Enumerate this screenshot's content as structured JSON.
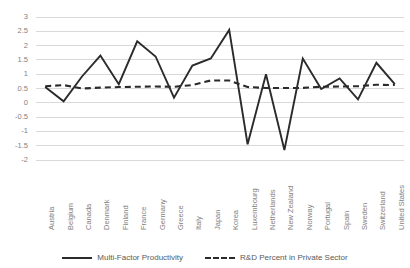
{
  "chart_data": {
    "type": "line",
    "title": "",
    "xlabel": "",
    "ylabel": "",
    "ylim": [
      -2,
      3
    ],
    "ytick_values": [
      3,
      2.5,
      2,
      1.5,
      1,
      0.5,
      0,
      -0.5,
      -1,
      -1.5,
      -2
    ],
    "ytick_labels": [
      "3",
      "2.5",
      "2",
      "1.5",
      "1",
      "0.5",
      "0",
      "-0.5",
      "-1",
      "-1.5",
      "-2"
    ],
    "grid": true,
    "legend_position": "bottom-center",
    "categories": [
      "Austria",
      "Belgium",
      "Canada",
      "Denmark",
      "Finland",
      "France",
      "Germany",
      "Greece",
      "Italy",
      "Japan",
      "Korea",
      "Luxembourg",
      "Netherlands",
      "New Zealand",
      "Norway",
      "Portugal",
      "Spain",
      "Sweden",
      "Switzerland",
      "United States"
    ],
    "series": [
      {
        "name": "Multi-Factor Productivity",
        "style": "solid",
        "color": "#2b2b2b",
        "values": [
          0.55,
          0.05,
          0.92,
          1.65,
          0.65,
          2.15,
          1.62,
          0.18,
          1.3,
          1.55,
          2.55,
          -1.45,
          1.0,
          -1.65,
          1.55,
          0.48,
          0.85,
          0.12,
          1.4,
          0.65
        ]
      },
      {
        "name": "R&D Percent in Private Sector",
        "style": "dashed",
        "color": "#2b2b2b",
        "values": [
          0.58,
          0.62,
          0.5,
          0.53,
          0.55,
          0.56,
          0.57,
          0.56,
          0.62,
          0.78,
          0.78,
          0.55,
          0.52,
          0.52,
          0.52,
          0.56,
          0.57,
          0.58,
          0.63,
          0.62
        ]
      }
    ]
  },
  "legend": {
    "items": [
      {
        "label": "Multi-Factor Productivity",
        "style": "solid"
      },
      {
        "label": "R&D Percent in Private Sector",
        "style": "dashed"
      }
    ]
  },
  "colors": {
    "line": "#2b2b2b",
    "grid": "#d9d9d9",
    "tick_text": "#7f7f7f",
    "legend_text": "#595959",
    "background": "#ffffff"
  }
}
